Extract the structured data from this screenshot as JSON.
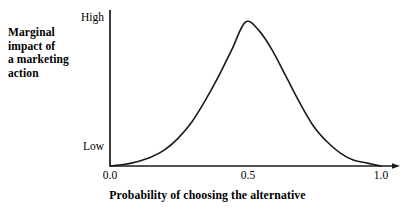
{
  "chart_data": {
    "type": "line",
    "title": "",
    "xlabel": "Probability of choosing the alternative",
    "ylabel": "Marginal impact of a marketing action",
    "ylabel_lines": [
      "Marginal",
      "impact of",
      "a marketing",
      "action"
    ],
    "xlim": [
      0.0,
      1.0
    ],
    "ylim": [
      0,
      1
    ],
    "xticks": [
      "0.0",
      "0.5",
      "1.0"
    ],
    "xtick_values": [
      0.0,
      0.5,
      1.0
    ],
    "yticks": [
      "Low",
      "High"
    ],
    "ytick_values": [
      0.0,
      1.0
    ],
    "grid": false,
    "legend": false,
    "series": [
      {
        "name": "Marginal impact",
        "description": "Bell-shaped (normal) curve peaking at probability 0.5",
        "x": [
          0.0,
          0.05,
          0.1,
          0.15,
          0.2,
          0.25,
          0.3,
          0.35,
          0.4,
          0.45,
          0.5,
          0.55,
          0.6,
          0.65,
          0.7,
          0.75,
          0.8,
          0.85,
          0.9,
          0.95,
          1.0
        ],
        "y": [
          0.0,
          0.01,
          0.03,
          0.06,
          0.11,
          0.19,
          0.3,
          0.45,
          0.62,
          0.81,
          1.0,
          0.94,
          0.8,
          0.62,
          0.44,
          0.28,
          0.17,
          0.09,
          0.04,
          0.02,
          0.0
        ]
      }
    ],
    "colors": {
      "curve": "#1a1a1a",
      "axis": "#1a1a1a",
      "background": "#ffffff",
      "text": "#000000"
    },
    "axis_style": {
      "x_axis_arrow": true,
      "y_axis_arrow": false,
      "ticks_visible": false
    }
  }
}
